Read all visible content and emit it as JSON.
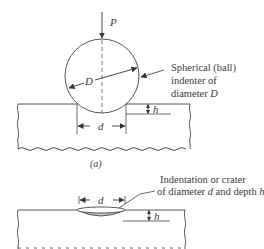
{
  "figure_a": {
    "load_label": "P",
    "diameter_label": "D",
    "indent_diameter_label": "d",
    "depth_label": "h",
    "callout_line1": "Spherical (ball)",
    "callout_line2": "indenter of",
    "callout_line3_prefix": "diameter ",
    "callout_line3_var": "D",
    "caption": "(a)"
  },
  "figure_b": {
    "indent_diameter_label": "d",
    "depth_label": "h",
    "callout_line1": "Indentation or crater",
    "callout_line2_a": "of diameter ",
    "callout_line2_var1": "d",
    "callout_line2_b": " and depth ",
    "callout_line2_var2": "h"
  },
  "colors": {
    "line": "#444444",
    "text": "#3a3a3a",
    "crater_fill": "#c8c8c8"
  }
}
